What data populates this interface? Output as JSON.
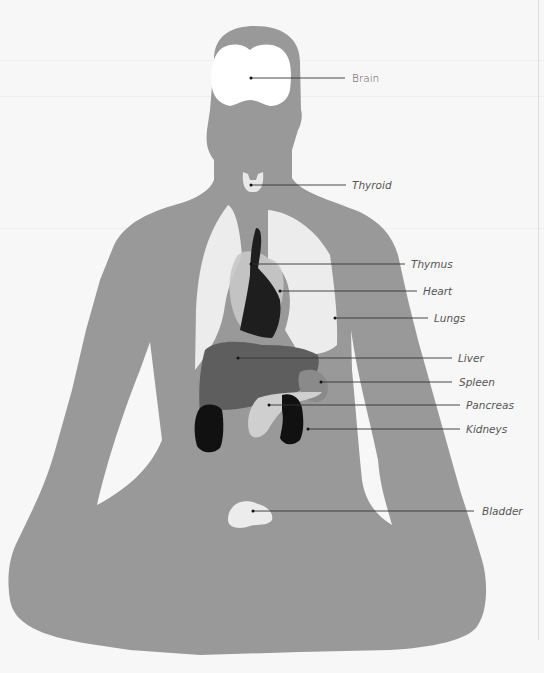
{
  "diagram": {
    "title": "",
    "type": "anatomical-organ-diagram",
    "colors": {
      "background": "#f7f7f7",
      "silhouette": "#999999",
      "brain": "#ffffff",
      "thyroid": "#e8e8e8",
      "lungs": "#ececec",
      "heart": "#1e1e1e",
      "thymus_overlay": "#c8c8c8",
      "liver": "#5e5e5e",
      "spleen": "#8a8a8a",
      "pancreas": "#cfcfcf",
      "kidneys": "#111111",
      "bladder": "#ececec",
      "leader_line": "#333333"
    },
    "labels": [
      {
        "id": "brain",
        "text": "Brain",
        "italic": false,
        "dot": [
          251,
          78
        ],
        "end": [
          345,
          78
        ],
        "text_pos": [
          352,
          78
        ]
      },
      {
        "id": "thyroid",
        "text": "Thyroid",
        "italic": true,
        "dot": [
          251,
          185
        ],
        "end": [
          346,
          185
        ],
        "text_pos": [
          352,
          185
        ]
      },
      {
        "id": "thymus",
        "text": "Thymus",
        "italic": true,
        "dot": [
          251,
          264
        ],
        "end": [
          405,
          264
        ],
        "text_pos": [
          411,
          264
        ]
      },
      {
        "id": "heart",
        "text": "Heart",
        "italic": true,
        "dot": [
          280,
          291
        ],
        "end": [
          417,
          291
        ],
        "text_pos": [
          423,
          291
        ]
      },
      {
        "id": "lungs",
        "text": "Lungs",
        "italic": true,
        "dot": [
          335,
          318
        ],
        "end": [
          428,
          318
        ],
        "text_pos": [
          434,
          318
        ]
      },
      {
        "id": "liver",
        "text": "Liver",
        "italic": true,
        "dot": [
          238,
          358
        ],
        "end": [
          452,
          358
        ],
        "text_pos": [
          458,
          358
        ]
      },
      {
        "id": "spleen",
        "text": "Spleen",
        "italic": true,
        "dot": [
          321,
          382
        ],
        "end": [
          452,
          382
        ],
        "text_pos": [
          459,
          382
        ]
      },
      {
        "id": "pancreas",
        "text": "Pancreas",
        "italic": true,
        "dot": [
          269,
          405
        ],
        "end": [
          460,
          405
        ],
        "text_pos": [
          466,
          405
        ]
      },
      {
        "id": "kidneys",
        "text": "Kidneys",
        "italic": true,
        "dot": [
          308,
          429
        ],
        "end": [
          460,
          429
        ],
        "text_pos": [
          466,
          429
        ]
      },
      {
        "id": "bladder",
        "text": "Bladder",
        "italic": true,
        "dot": [
          253,
          511
        ],
        "end": [
          474,
          511
        ],
        "text_pos": [
          482,
          511
        ]
      }
    ]
  }
}
